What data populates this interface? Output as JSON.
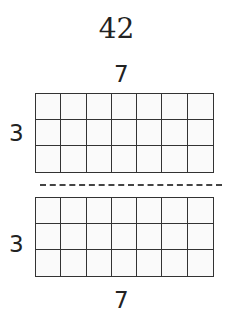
{
  "diagram": {
    "total": "42",
    "top_array": {
      "columns_label": "7",
      "rows_label": "3",
      "columns": 7,
      "rows": 3
    },
    "bottom_array": {
      "columns_label": "7",
      "rows_label": "3",
      "columns": 7,
      "rows": 3
    },
    "separator": "dashed-line"
  }
}
